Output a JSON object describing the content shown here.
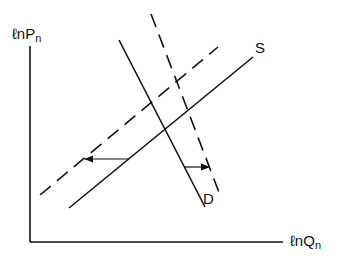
{
  "diagram": {
    "type": "supply-demand",
    "y_axis_label": {
      "prefix": "ℓn",
      "main": "P",
      "sub": "n"
    },
    "x_axis_label": {
      "prefix": "ℓn",
      "main": "Q",
      "sub": "n"
    },
    "curves": [
      {
        "name": "S",
        "style": "solid",
        "label": "S"
      },
      {
        "name": "S-shifted",
        "style": "dashed",
        "label": ""
      },
      {
        "name": "D",
        "style": "solid",
        "label": "D"
      },
      {
        "name": "D-shifted",
        "style": "dashed",
        "label": ""
      }
    ],
    "shifts": [
      {
        "curve": "S",
        "direction": "left"
      },
      {
        "curve": "D",
        "direction": "right"
      }
    ],
    "colors": {
      "line": "#111111",
      "background": "#ffffff"
    }
  }
}
